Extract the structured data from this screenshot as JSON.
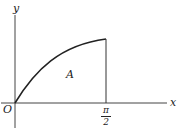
{
  "diagram": {
    "type": "area-under-curve",
    "axes": {
      "x_label": "x",
      "y_label": "y",
      "origin_label": "O"
    },
    "curve": "y = sin x",
    "region_label": "A",
    "x_tick": {
      "numerator": "π",
      "denominator": "2"
    },
    "colors": {
      "stroke": "#222222",
      "background": "#ffffff"
    }
  }
}
